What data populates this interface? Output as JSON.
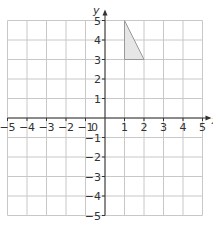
{
  "diagram": {
    "type": "coordinate-grid",
    "x_axis_label": "x",
    "y_axis_label": "y",
    "origin_label": "0",
    "x_range": [
      -5,
      5
    ],
    "y_range": [
      -5,
      5
    ],
    "x_ticks": [
      "−5",
      "−4",
      "−3",
      "−2",
      "−1",
      "1",
      "2",
      "3",
      "4",
      "5"
    ],
    "y_ticks": [
      "5",
      "4",
      "3",
      "2",
      "1",
      "−1",
      "−2",
      "−3",
      "−4",
      "−5"
    ],
    "shape": {
      "type": "triangle",
      "vertices": [
        [
          1,
          5
        ],
        [
          1,
          3
        ],
        [
          2,
          3
        ]
      ],
      "fill": "#e6e6e6",
      "stroke": "#999999"
    },
    "colors": {
      "grid": "#c8c8c8",
      "axis": "#333333"
    }
  }
}
